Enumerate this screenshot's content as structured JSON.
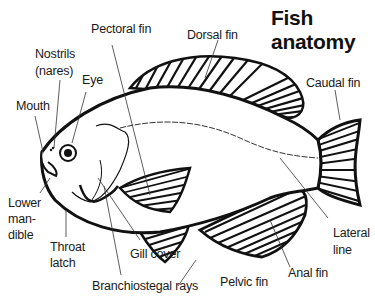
{
  "title": {
    "line1": "Fish",
    "line2": "anatomy"
  },
  "labels": {
    "pectoral_fin": "Pectoral fin",
    "dorsal_fin": "Dorsal fin",
    "nostrils_line1": "Nostrils",
    "nostrils_line2": "(nares)",
    "eye": "Eye",
    "mouth": "Mouth",
    "caudal_fin": "Caudal fin",
    "lower_mandible_line1": "Lower",
    "lower_mandible_line2": "man-",
    "lower_mandible_line3": "dible",
    "throat_latch_line1": "Throat",
    "throat_latch_line2": "latch",
    "gill_cover": "Gill cover",
    "branchiostegal_rays": "Branchiostegal rays",
    "pelvic_fin": "Pelvic fin",
    "anal_fin": "Anal fin",
    "lateral_line_line1": "Lateral",
    "lateral_line_line2": "line"
  },
  "colors": {
    "ink": "#111111",
    "background": "#ffffff"
  }
}
